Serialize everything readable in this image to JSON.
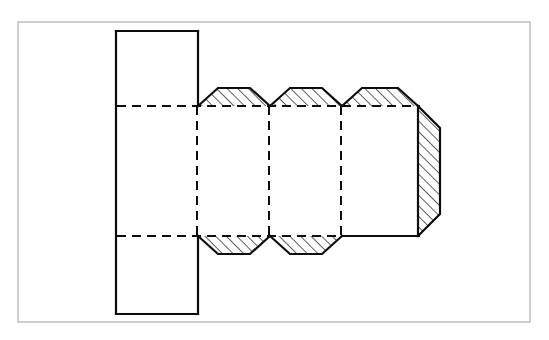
{
  "document": {
    "title": "Hex Head Bolt Sectional View",
    "type": "engineering-drawing",
    "canvas_width": 549,
    "canvas_height": 340,
    "background_color": "#ffffff"
  },
  "style": {
    "outline_color": "#0d0d0d",
    "hidden_line_color": "#0d0d0d",
    "hatch_color": "#0d0d0d",
    "frame_color": "#b8b8b8",
    "outline_width": 2.2,
    "hidden_line_width": 2.0,
    "hatch_width": 1.3,
    "frame_width": 1.4,
    "dash_pattern": "9 6"
  },
  "frame": {
    "label": "drawing-border",
    "x": 18,
    "y": 22,
    "width": 512,
    "height": 300
  },
  "geometry": {
    "head": {
      "label": "bolt-head-rectangle",
      "x": 116,
      "y": 31,
      "width": 82,
      "height": 283,
      "right_edge_x": 198,
      "top_y": 31,
      "bottom_y": 314
    },
    "axis_band": {
      "label": "shank-core-band",
      "top_y": 106,
      "bottom_y": 236
    },
    "shank": {
      "label": "threaded-shank",
      "start_x": 198,
      "end_x": 418,
      "crest_top_y": 88,
      "crest_bottom_y": 254,
      "root_top_y": 106,
      "root_bottom_y": 236,
      "pitch": 72,
      "chamfer_run": 20
    },
    "thread_segments": [
      {
        "label": "thread-turn-1",
        "left_x": 198,
        "right_x": 270
      },
      {
        "label": "thread-turn-2",
        "left_x": 270,
        "right_x": 342
      },
      {
        "label": "thread-turn-3",
        "left_x": 342,
        "right_x": 414
      }
    ],
    "hidden_verticals": [
      {
        "label": "hidden-line-1",
        "x": 197
      },
      {
        "label": "hidden-line-2",
        "x": 269
      },
      {
        "label": "hidden-line-3",
        "x": 341
      }
    ],
    "hidden_horizontals": [
      {
        "label": "hidden-top-band",
        "x1": 117,
        "x2": 420,
        "y": 106
      },
      {
        "label": "hidden-bottom-band",
        "x1": 117,
        "x2": 420,
        "y": 236
      }
    ],
    "end_chamfer": {
      "label": "bolt-end-chamfer",
      "face_x": 418,
      "outer_x": 440,
      "top_y": 106,
      "bottom_y": 236,
      "chamfer_top_y": 128,
      "chamfer_bottom_y": 214
    }
  },
  "hatching": {
    "label": "section-hatch",
    "angle_deg": 45,
    "spacing": 7.5,
    "regions": [
      "upper-thread-1",
      "upper-thread-2",
      "upper-thread-3",
      "lower-thread-1",
      "lower-thread-2",
      "end-chamfer-face"
    ]
  }
}
